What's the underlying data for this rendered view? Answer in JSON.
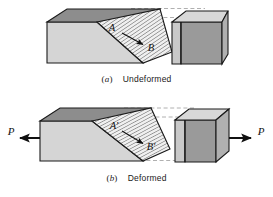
{
  "figure": {
    "type": "engineering-illustration",
    "panels": [
      {
        "id": "a",
        "paren_open": "(",
        "paren_close": ")",
        "tag": "a",
        "caption": "Undeformed",
        "point_labels": [
          "A",
          "B"
        ],
        "arrow": {
          "from": "A",
          "to": "B"
        },
        "load_labels": [],
        "guides": "two horizontal dashed lines aligning the top of both blocks"
      },
      {
        "id": "b",
        "paren_open": "(",
        "paren_close": ")",
        "tag": "b",
        "caption": "Deformed",
        "point_labels": [
          "A'",
          "B'"
        ],
        "arrow": {
          "from": "A'",
          "to": "B'"
        },
        "load_labels": [
          "P",
          "P"
        ],
        "guides": "dashed lines showing original undeformed outline and alignment"
      }
    ],
    "colors": {
      "outline": "#1a1a1a",
      "face_front_light": "#d4d4d4",
      "face_top_dark": "#8a8a8a",
      "face_side_dark": "#9a9a9a",
      "face_edge_light": "#c9c9c9",
      "hatch_fill": "#efefef",
      "hatch_line": "#2b2b2b",
      "dashed_guide": "#9c9c9c",
      "background": "#ffffff",
      "arrow": "#111111"
    }
  }
}
